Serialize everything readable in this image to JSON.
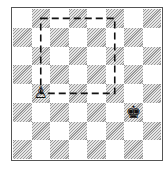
{
  "diagram": {
    "type": "chess-board",
    "files": [
      "a",
      "b",
      "c",
      "d",
      "e",
      "f",
      "g",
      "h"
    ],
    "ranks": [
      8,
      7,
      6,
      5,
      4,
      3,
      2,
      1
    ],
    "top_left_square_color": "light",
    "pieces": [
      {
        "square": "b4",
        "piece": "white-pawn",
        "glyph": "♙",
        "icon": "white-pawn-icon"
      },
      {
        "square": "g3",
        "piece": "black-king",
        "glyph": "♚",
        "icon": "black-king-icon"
      }
    ],
    "annotation": {
      "type": "dashed-square",
      "label": "rule of the square",
      "corners": [
        "b8",
        "f8",
        "f4",
        "b4"
      ]
    },
    "colors": {
      "light_square": "#ffffff",
      "dark_square_hatch": "#9a9a9a",
      "border": "#555555",
      "dashed_line": "#111111"
    }
  }
}
